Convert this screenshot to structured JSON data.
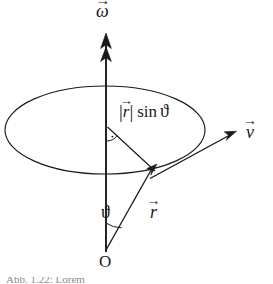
{
  "figure": {
    "type": "physics-vector-diagram",
    "background_color": "#ffffff",
    "stroke_color": "#1a1a1a",
    "width": 273,
    "height": 284
  },
  "labels": {
    "omega": {
      "symbol": "ω",
      "vector_arrow": "→",
      "name": "angular-velocity"
    },
    "v": {
      "symbol": "v",
      "vector_arrow": "→",
      "name": "linear-velocity"
    },
    "r": {
      "symbol": "r",
      "vector_arrow": "→",
      "name": "position-vector"
    },
    "radius_expression": {
      "bar_open": "|",
      "r_symbol": "r",
      "vector_arrow": "→",
      "bar_close": "|",
      "function": "sin",
      "angle_symbol": "ϑ",
      "full_text": "|r⃗| sin ϑ"
    },
    "theta": {
      "symbol": "ϑ",
      "name": "polar-angle"
    },
    "origin": {
      "symbol": "O",
      "name": "origin-point"
    },
    "caption": {
      "text": "Abb. 1.22: Lorem",
      "visible": "partially-cropped"
    }
  },
  "geometry": {
    "origin_point": {
      "x": 106,
      "y": 250
    },
    "axis": {
      "x": 106,
      "y_top": 34,
      "y_bottom": 252
    },
    "ellipse": {
      "cx": 105,
      "cy": 130,
      "rx": 100,
      "ry": 44
    },
    "r_vector": {
      "x1": 106,
      "y1": 250,
      "x2": 156,
      "y2": 171
    },
    "v_vector": {
      "x1": 150,
      "y1": 178,
      "x2": 236,
      "y2": 132
    },
    "radius_segment": {
      "x1": 107,
      "y1": 127,
      "x2": 155,
      "y2": 171
    },
    "right_angle_marker": {
      "x": 107,
      "y": 127
    },
    "theta_arc": {
      "cx": 106,
      "cy": 250,
      "radius": 42
    }
  }
}
